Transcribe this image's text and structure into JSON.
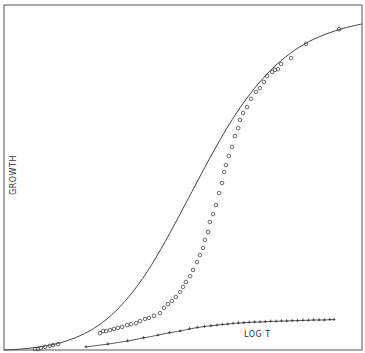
{
  "chart_data": {
    "type": "scatter",
    "title": "",
    "xlabel": "LOG  T",
    "ylabel": "GROWTH",
    "xlim": [
      0,
      10
    ],
    "ylim": [
      0,
      100
    ],
    "grid": false,
    "legend": "none",
    "series": [
      {
        "name": "fitted curve",
        "kind": "line",
        "color": "#444444",
        "x": [
          0.0,
          0.5,
          1.0,
          1.5,
          2.0,
          2.5,
          3.0,
          3.5,
          4.0,
          4.5,
          5.0,
          5.5,
          6.0,
          6.5,
          7.0,
          7.5,
          8.0,
          8.5,
          9.0,
          9.5,
          10.0
        ],
        "y": [
          0.0,
          0.3,
          0.9,
          1.9,
          3.6,
          6.2,
          10.1,
          15.6,
          22.7,
          31.4,
          41.0,
          50.8,
          60.3,
          68.8,
          75.9,
          81.6,
          86.0,
          89.3,
          91.6,
          93.3,
          94.5
        ]
      },
      {
        "name": "circles",
        "kind": "points",
        "marker": "circle",
        "color": "#444444",
        "x": [
          0.87,
          0.95,
          1.03,
          1.15,
          1.28,
          1.37,
          1.51,
          2.68,
          2.77,
          2.85,
          2.96,
          3.07,
          3.18,
          3.3,
          3.44,
          3.55,
          3.69,
          3.8,
          3.94,
          4.05,
          4.19,
          4.36,
          4.47,
          4.58,
          4.69,
          4.8,
          4.92,
          5.0,
          5.08,
          5.2,
          5.28,
          5.39,
          5.47,
          5.56,
          5.61,
          5.7,
          5.75,
          5.84,
          5.92,
          6.01,
          6.09,
          6.15,
          6.2,
          6.28,
          6.37,
          6.45,
          6.54,
          6.59,
          6.68,
          6.79,
          6.9,
          7.04,
          7.15,
          7.26,
          7.35,
          7.49,
          7.57,
          7.65,
          7.74,
          8.02,
          8.44,
          9.36
        ],
        "y": [
          0.3,
          0.3,
          0.6,
          0.9,
          1.2,
          1.4,
          1.7,
          4.9,
          5.5,
          5.5,
          5.8,
          6.1,
          6.4,
          6.7,
          7.2,
          7.5,
          7.8,
          8.4,
          9.0,
          9.3,
          9.9,
          10.7,
          12.2,
          13.3,
          14.2,
          15.4,
          16.8,
          18.3,
          19.7,
          21.4,
          23.2,
          25.5,
          27.5,
          29.6,
          31.9,
          34.2,
          37.1,
          39.4,
          42.0,
          45.5,
          48.4,
          51.6,
          53.6,
          56.2,
          58.8,
          62.0,
          64.3,
          66.7,
          68.7,
          70.4,
          72.8,
          74.8,
          75.9,
          77.7,
          79.4,
          80.6,
          81.2,
          81.4,
          82.9,
          84.6,
          88.7,
          93.0
        ]
      },
      {
        "name": "crosses",
        "kind": "points",
        "marker": "plus",
        "color": "#333333",
        "x": [
          2.29,
          2.9,
          3.45,
          3.9,
          4.3,
          4.62,
          4.92,
          5.18,
          5.4,
          5.6,
          5.78,
          5.95,
          6.1,
          6.25,
          6.4,
          6.55,
          6.7,
          6.85,
          7.0,
          7.15,
          7.3,
          7.45,
          7.6,
          7.75,
          7.9,
          8.05,
          8.2,
          8.35,
          8.5,
          8.65,
          8.8,
          8.95,
          9.1,
          9.22
        ],
        "y": [
          0.9,
          1.7,
          2.6,
          3.5,
          4.3,
          5.0,
          5.5,
          6.1,
          6.5,
          6.8,
          7.0,
          7.2,
          7.4,
          7.5,
          7.7,
          7.8,
          7.9,
          8.0,
          8.1,
          8.1,
          8.2,
          8.3,
          8.3,
          8.4,
          8.4,
          8.5,
          8.5,
          8.6,
          8.6,
          8.7,
          8.7,
          8.7,
          8.8,
          8.8
        ]
      }
    ]
  }
}
